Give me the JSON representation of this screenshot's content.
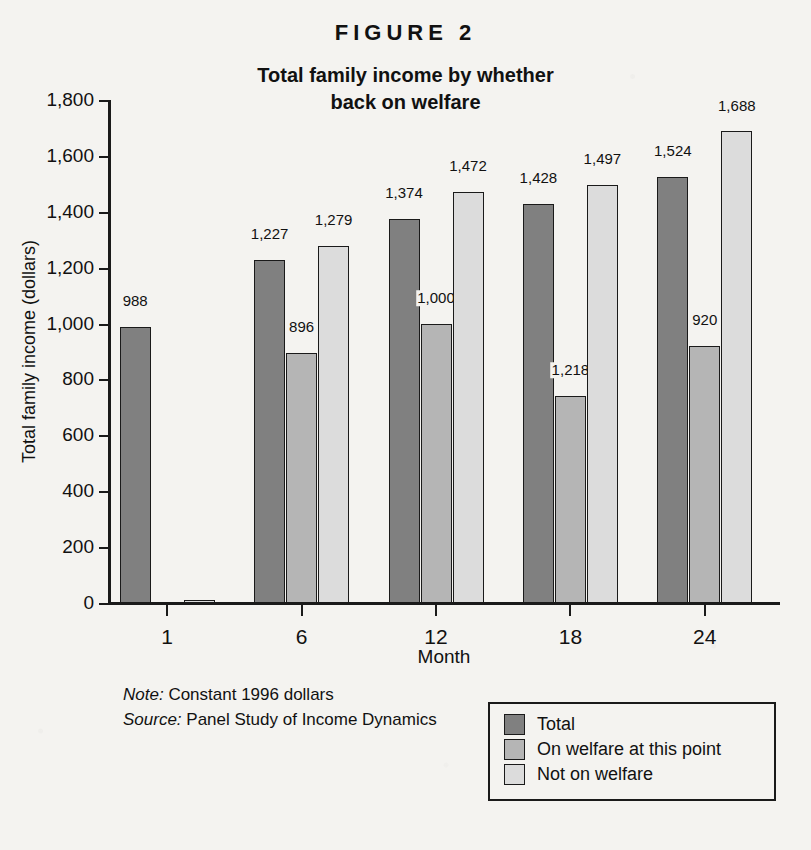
{
  "figure_label": "FIGURE 2",
  "title_line1": "Total family income by whether",
  "title_line2": "back on welfare",
  "notes": {
    "note_prefix": "Note:",
    "note_text": "Constant 1996 dollars",
    "source_prefix": "Source:",
    "source_text": "Panel Study of Income Dynamics"
  },
  "legend": {
    "items": [
      {
        "label": "Total",
        "color": "#808080"
      },
      {
        "label": "On welfare at this point",
        "color": "#b5b5b5"
      },
      {
        "label": "Not on welfare",
        "color": "#dcdcdc"
      }
    ]
  },
  "chart_data": {
    "type": "bar",
    "title": "Total family income by whether back on welfare",
    "xlabel": "Month",
    "ylabel": "Total family income (dollars)",
    "ylim": [
      0,
      1800
    ],
    "ytick_values": [
      0,
      200,
      400,
      600,
      800,
      1000,
      1200,
      1400,
      1600,
      1800
    ],
    "ytick_labels": [
      "0",
      "200",
      "400",
      "600",
      "800",
      "1,000",
      "1,200",
      "1,400",
      "1,600",
      "1,800"
    ],
    "grid": false,
    "legend_position": "bottom-right",
    "categories": [
      "1",
      "6",
      "12",
      "18",
      "24"
    ],
    "series": [
      {
        "name": "Total",
        "color": "#808080",
        "values": [
          988,
          1227,
          1374,
          1428,
          1524
        ],
        "drawn_values": [
          988,
          1227,
          1374,
          1428,
          1524
        ],
        "labels": [
          "988",
          "1,227",
          "1,374",
          "1,428",
          "1,524"
        ]
      },
      {
        "name": "On welfare at this point",
        "color": "#b5b5b5",
        "values": [
          0,
          896,
          1000,
          1218,
          920
        ],
        "drawn_values": [
          0,
          896,
          1000,
          740,
          920
        ],
        "labels": [
          "",
          "896",
          "1,000",
          "1,218",
          "920"
        ]
      },
      {
        "name": "Not on welfare",
        "color": "#dcdcdc",
        "values": [
          0,
          1279,
          1472,
          1497,
          1688
        ],
        "drawn_values": [
          12,
          1279,
          1472,
          1497,
          1688
        ],
        "labels": [
          "",
          "1,279",
          "1,472",
          "1,497",
          "1,688"
        ]
      }
    ]
  }
}
